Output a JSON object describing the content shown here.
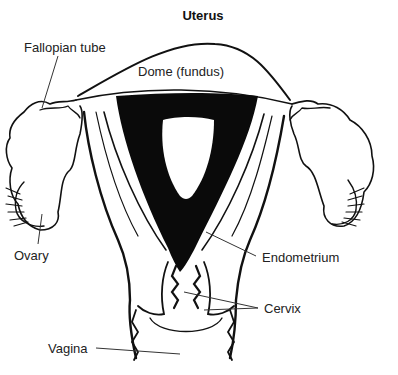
{
  "diagram": {
    "title": "Uterus",
    "labels": {
      "fallopian_tube": "Fallopian tube",
      "dome": "Dome (fundus)",
      "ovary": "Ovary",
      "endometrium": "Endometrium",
      "cervix": "Cervix",
      "vagina": "Vagina"
    },
    "colors": {
      "line": "#111111",
      "fill_dark": "#0a0a0a",
      "background": "#ffffff",
      "label_text": "#222222"
    }
  }
}
